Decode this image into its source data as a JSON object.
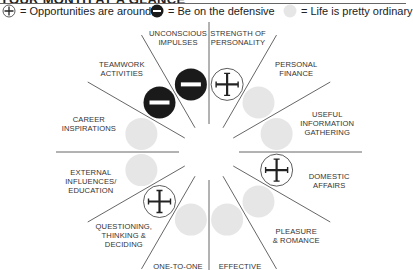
{
  "title": "YOUR MONTH AT A GLANCE",
  "legend": [
    {
      "symbol": "plus-circle",
      "label": "= Opportunities are around"
    },
    {
      "symbol": "minus-circle",
      "label": "= Be on the defensive"
    },
    {
      "symbol": "grey-circle",
      "label": "= Life is pretty ordinary"
    }
  ],
  "colors": {
    "ordinary": "#e6e6e6",
    "defensive": "#1a1a1a",
    "opportunity_stroke": "#333333",
    "line": "#555555"
  },
  "sectors": [
    {
      "label_lines": [
        "STRENGTH OF",
        "PERSONALITY"
      ],
      "status": "opportunity"
    },
    {
      "label_lines": [
        "PERSONAL",
        "FINANCE"
      ],
      "status": "ordinary"
    },
    {
      "label_lines": [
        "USEFUL",
        "INFORMATION",
        "GATHERING"
      ],
      "status": "ordinary"
    },
    {
      "label_lines": [
        "DOMESTIC",
        "AFFAIRS"
      ],
      "status": "opportunity"
    },
    {
      "label_lines": [
        "PLEASURE",
        "& ROMANCE"
      ],
      "status": "ordinary"
    },
    {
      "label_lines": [
        "EFFECTIVE",
        "WORK & HEALTH"
      ],
      "status": "ordinary"
    },
    {
      "label_lines": [
        "ONE-TO-ONE",
        "RELATIONSHIPS"
      ],
      "status": "ordinary"
    },
    {
      "label_lines": [
        "QUESTIONING,",
        "THINKING &",
        "DECIDING"
      ],
      "status": "opportunity"
    },
    {
      "label_lines": [
        "EXTERNAL",
        "INFLUENCES/",
        "EDUCATION"
      ],
      "status": "ordinary"
    },
    {
      "label_lines": [
        "CAREER",
        "INSPIRATIONS"
      ],
      "status": "ordinary"
    },
    {
      "label_lines": [
        "TEAMWORK",
        "ACTIVITIES"
      ],
      "status": "defensive"
    },
    {
      "label_lines": [
        "UNCONSCIOUS",
        "IMPULSES"
      ],
      "status": "defensive"
    }
  ]
}
